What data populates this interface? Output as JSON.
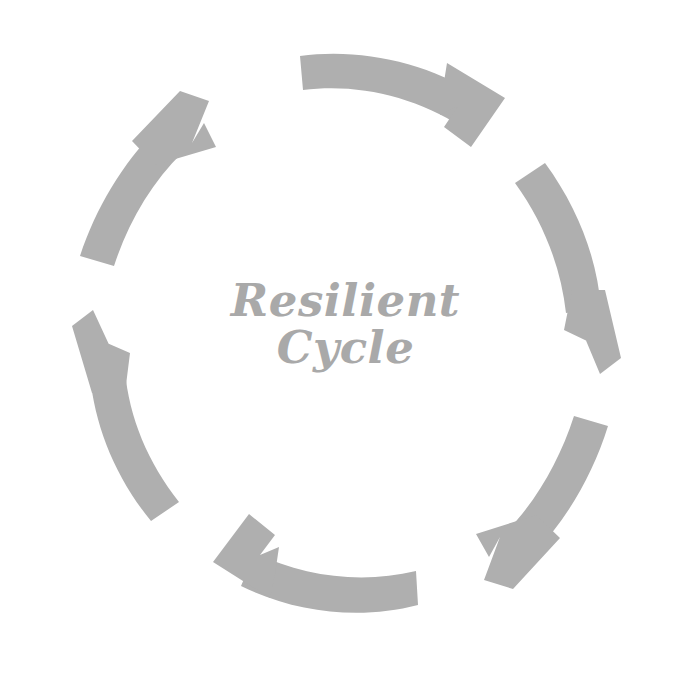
{
  "canvas": {
    "width": 691,
    "height": 686,
    "background_color": "#ffffff"
  },
  "diagram": {
    "kind": "circular-cycle-diagram",
    "arrow_color": "#afafaf",
    "text_color": "#a9a9a9",
    "direction": "clockwise",
    "arrow_count": 6,
    "center": {
      "line_1": "Resilient",
      "line_2": "Cycle"
    },
    "arrows": [
      {
        "name": "arrow-top",
        "position": "top",
        "points_to": "right",
        "start_angle_deg": -108,
        "end_angle_deg": -38
      },
      {
        "name": "arrow-upper-right",
        "position": "upper-right",
        "points_to": "down-right",
        "start_angle_deg": -48,
        "end_angle_deg": 22
      },
      {
        "name": "arrow-lower-right",
        "position": "lower-right",
        "points_to": "down-left",
        "start_angle_deg": 12,
        "end_angle_deg": 82
      },
      {
        "name": "arrow-bottom",
        "position": "bottom",
        "points_to": "left",
        "start_angle_deg": 72,
        "end_angle_deg": 142
      },
      {
        "name": "arrow-lower-left",
        "position": "lower-left",
        "points_to": "up-left",
        "start_angle_deg": 132,
        "end_angle_deg": 202
      },
      {
        "name": "arrow-upper-left",
        "position": "upper-left",
        "points_to": "up-right",
        "start_angle_deg": 192,
        "end_angle_deg": 262
      }
    ]
  }
}
